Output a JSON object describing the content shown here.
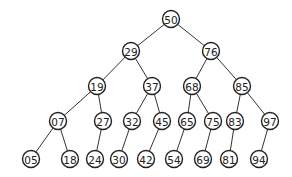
{
  "diagram": {
    "type": "binary-search-tree",
    "nodes": [
      {
        "id": "n50",
        "label": "50",
        "x": 171,
        "y": 19
      },
      {
        "id": "n29",
        "label": "29",
        "x": 131,
        "y": 51
      },
      {
        "id": "n76",
        "label": "76",
        "x": 211,
        "y": 51
      },
      {
        "id": "n19",
        "label": "19",
        "x": 97,
        "y": 86
      },
      {
        "id": "n37",
        "label": "37",
        "x": 152,
        "y": 86
      },
      {
        "id": "n68",
        "label": "68",
        "x": 192,
        "y": 86
      },
      {
        "id": "n85",
        "label": "85",
        "x": 242,
        "y": 86
      },
      {
        "id": "n07",
        "label": "07",
        "x": 58,
        "y": 121
      },
      {
        "id": "n27",
        "label": "27",
        "x": 103,
        "y": 121
      },
      {
        "id": "n32",
        "label": "32",
        "x": 132,
        "y": 121
      },
      {
        "id": "n45",
        "label": "45",
        "x": 162,
        "y": 121
      },
      {
        "id": "n65",
        "label": "65",
        "x": 187,
        "y": 121
      },
      {
        "id": "n75",
        "label": "75",
        "x": 213,
        "y": 121
      },
      {
        "id": "n83",
        "label": "83",
        "x": 235,
        "y": 121
      },
      {
        "id": "n97",
        "label": "97",
        "x": 270,
        "y": 121
      },
      {
        "id": "n05",
        "label": "05",
        "x": 31,
        "y": 159
      },
      {
        "id": "n18",
        "label": "18",
        "x": 70,
        "y": 159
      },
      {
        "id": "n24",
        "label": "24",
        "x": 95,
        "y": 159
      },
      {
        "id": "n30",
        "label": "30",
        "x": 119,
        "y": 159
      },
      {
        "id": "n42",
        "label": "42",
        "x": 146,
        "y": 159
      },
      {
        "id": "n54",
        "label": "54",
        "x": 174,
        "y": 159
      },
      {
        "id": "n69",
        "label": "69",
        "x": 203,
        "y": 159
      },
      {
        "id": "n81",
        "label": "81",
        "x": 229,
        "y": 159
      },
      {
        "id": "n94",
        "label": "94",
        "x": 259,
        "y": 159
      }
    ],
    "edges": [
      [
        "n50",
        "n29"
      ],
      [
        "n50",
        "n76"
      ],
      [
        "n29",
        "n19"
      ],
      [
        "n29",
        "n37"
      ],
      [
        "n76",
        "n68"
      ],
      [
        "n76",
        "n85"
      ],
      [
        "n19",
        "n07"
      ],
      [
        "n19",
        "n27"
      ],
      [
        "n37",
        "n32"
      ],
      [
        "n37",
        "n45"
      ],
      [
        "n68",
        "n65"
      ],
      [
        "n68",
        "n75"
      ],
      [
        "n85",
        "n83"
      ],
      [
        "n85",
        "n97"
      ],
      [
        "n07",
        "n05"
      ],
      [
        "n07",
        "n18"
      ],
      [
        "n27",
        "n24"
      ],
      [
        "n32",
        "n30"
      ],
      [
        "n45",
        "n42"
      ],
      [
        "n65",
        "n54"
      ],
      [
        "n75",
        "n69"
      ],
      [
        "n83",
        "n81"
      ],
      [
        "n97",
        "n94"
      ]
    ],
    "node_radius": 8.5
  }
}
